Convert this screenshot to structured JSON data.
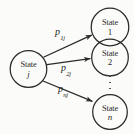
{
  "figure": {
    "type": "state-transition-diagram",
    "background_color": "#fbfbfa",
    "stroke_color": "#2b2b2b",
    "width": 134,
    "height": 134
  },
  "nodes": {
    "source": {
      "word": "State",
      "index": "j",
      "index_style": "italic",
      "cx": 28.5,
      "cy": 69,
      "r": 18.5
    },
    "targets": [
      {
        "word": "State",
        "index": "1",
        "index_style": "upright",
        "cx": 110,
        "cy": 27,
        "r": 19
      },
      {
        "word": "State",
        "index": "2",
        "index_style": "upright",
        "cx": 110,
        "cy": 57.5,
        "r": 18.5
      },
      {
        "word": "State",
        "index": "n",
        "index_style": "italic",
        "cx": 110,
        "cy": 112,
        "r": 17.5
      }
    ]
  },
  "ellipsis": {
    "name": "vertical-ellipsis",
    "dot_count": 3,
    "x": 110,
    "y_top": 76,
    "y_bottom": 89
  },
  "edges": [
    {
      "label_base": "p",
      "label_sub": "1j",
      "from": "State j",
      "to": "State 1",
      "label_x": 55,
      "label_y": 29,
      "x1": 44,
      "y1": 57,
      "x2": 92.5,
      "y2": 35.5
    },
    {
      "label_base": "p",
      "label_sub": "2j",
      "from": "State j",
      "to": "State 2",
      "label_x": 61,
      "label_y": 65,
      "x1": 47,
      "y1": 64.5,
      "x2": 91,
      "y2": 58.5
    },
    {
      "label_base": "p",
      "label_sub": "nj",
      "from": "State j",
      "to": "State n",
      "label_x": 58,
      "label_y": 86,
      "x1": 43,
      "y1": 81,
      "x2": 93,
      "y2": 101.5
    }
  ]
}
